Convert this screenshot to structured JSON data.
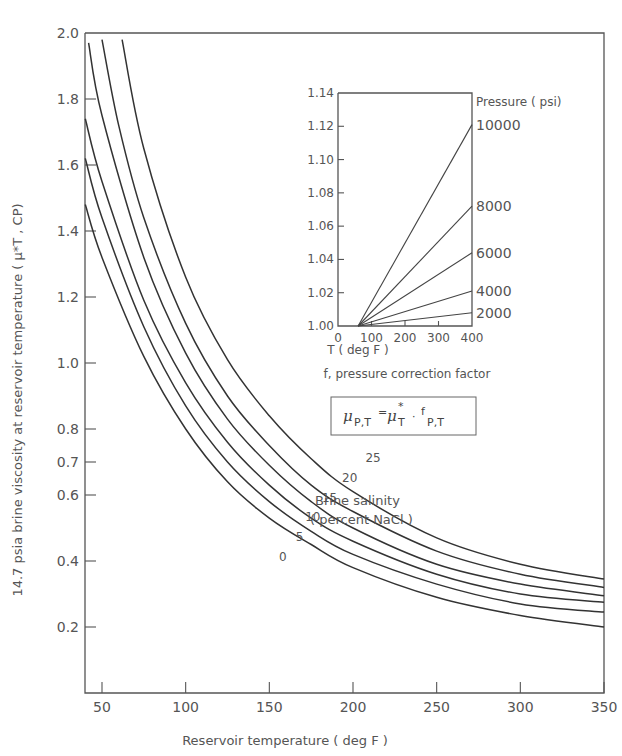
{
  "chart_data": [
    {
      "type": "line",
      "title": "",
      "xlabel": "Reservoir temperature (deg F)",
      "ylabel": "14.7 psia brine viscosity at reservoir temperature (μ*T, CP)",
      "xlim": [
        40,
        350
      ],
      "ylim": [
        0,
        2.0
      ],
      "xticks": [
        50,
        100,
        150,
        200,
        250,
        300,
        350
      ],
      "yticks": [
        0.2,
        0.4,
        0.6,
        0.7,
        0.8,
        1.0,
        1.2,
        1.4,
        1.6,
        1.8,
        2.0
      ],
      "ytick_labels": [
        "0.2",
        "0.4",
        "0.6",
        "0.7",
        "0.8",
        "1.0",
        "1.2",
        "1.4",
        "1.6",
        "1.8",
        "2.0"
      ],
      "grid": false,
      "legend_title": "Brine salinity",
      "legend_subtitle": "(percent NaCl)",
      "series": [
        {
          "name": "0",
          "x": [
            40,
            50,
            75,
            100,
            125,
            150,
            175,
            200,
            250,
            300,
            350
          ],
          "y": [
            1.48,
            1.32,
            1.02,
            0.8,
            0.64,
            0.53,
            0.45,
            0.38,
            0.29,
            0.235,
            0.2
          ]
        },
        {
          "name": "5",
          "x": [
            40,
            50,
            75,
            100,
            125,
            150,
            175,
            200,
            250,
            300,
            350
          ],
          "y": [
            1.62,
            1.44,
            1.11,
            0.87,
            0.7,
            0.58,
            0.49,
            0.42,
            0.33,
            0.27,
            0.245
          ]
        },
        {
          "name": "10",
          "x": [
            40,
            50,
            75,
            100,
            125,
            150,
            175,
            200,
            250,
            300,
            350
          ],
          "y": [
            1.74,
            1.55,
            1.19,
            0.94,
            0.76,
            0.63,
            0.53,
            0.46,
            0.36,
            0.3,
            0.275
          ]
        },
        {
          "name": "15",
          "x": [
            42,
            50,
            75,
            100,
            125,
            150,
            175,
            200,
            250,
            300,
            350
          ],
          "y": [
            1.97,
            1.75,
            1.32,
            1.03,
            0.83,
            0.69,
            0.58,
            0.5,
            0.39,
            0.33,
            0.295
          ]
        },
        {
          "name": "20",
          "x": [
            50,
            60,
            75,
            100,
            125,
            150,
            175,
            200,
            250,
            300,
            350
          ],
          "y": [
            1.98,
            1.72,
            1.44,
            1.12,
            0.9,
            0.75,
            0.63,
            0.55,
            0.43,
            0.36,
            0.32
          ]
        },
        {
          "name": "25",
          "x": [
            62,
            75,
            100,
            125,
            150,
            175,
            200,
            250,
            300,
            350
          ],
          "y": [
            1.98,
            1.65,
            1.26,
            1.01,
            0.84,
            0.71,
            0.61,
            0.47,
            0.39,
            0.345
          ]
        }
      ],
      "curve_labels": [
        "0",
        "5",
        "10",
        "15",
        "20",
        "25"
      ]
    },
    {
      "type": "line",
      "title": "f, pressure correction factor",
      "xlabel": "T (deg F)",
      "ylabel": "",
      "xlim": [
        0,
        400
      ],
      "ylim": [
        1.0,
        1.14
      ],
      "xticks": [
        0,
        100,
        200,
        300,
        400
      ],
      "yticks": [
        1.0,
        1.02,
        1.04,
        1.06,
        1.08,
        1.1,
        1.12,
        1.14
      ],
      "ytick_labels": [
        "1.00",
        "1.02",
        "1.04",
        "1.06",
        "1.08",
        "1.10",
        "1.12",
        "1.14"
      ],
      "grid": false,
      "legend_title": "Pressure (psi)",
      "series": [
        {
          "name": "2000",
          "x": [
            60,
            400
          ],
          "y": [
            1.0,
            1.008
          ]
        },
        {
          "name": "4000",
          "x": [
            60,
            400
          ],
          "y": [
            1.0,
            1.021
          ]
        },
        {
          "name": "6000",
          "x": [
            60,
            400
          ],
          "y": [
            1.0,
            1.044
          ]
        },
        {
          "name": "8000",
          "x": [
            60,
            400
          ],
          "y": [
            1.0,
            1.072
          ]
        },
        {
          "name": "10000",
          "x": [
            60,
            400
          ],
          "y": [
            1.0,
            1.121
          ]
        }
      ]
    }
  ],
  "labels": {
    "x_axis": "Reservoir temperature  ( deg F )",
    "y_axis": "14.7 psia brine viscosity at reservoir temperature  ( μ*T ,  CP)",
    "legend_line1": "Brine salinity",
    "legend_line2": "( percent NaCl )",
    "inset_title": "f, pressure correction factor",
    "inset_xlabel": "T  ( deg F )",
    "inset_legend": "Pressure ( psi)",
    "formula_lhs": "μ",
    "formula_lhs_sub": "P,T",
    "formula_eq": "=",
    "formula_mu": "μ",
    "formula_mu_sup": "*",
    "formula_mu_sub": "T",
    "formula_dot": "·",
    "formula_f": "f",
    "formula_f_sub": "P,T"
  }
}
